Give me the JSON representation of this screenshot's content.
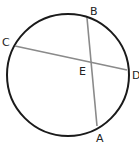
{
  "diagram": {
    "type": "circle-intersecting-chords",
    "colors": {
      "circle": "#1a1a1a",
      "chord": "#8a8a8a",
      "label": "#222222",
      "background": "#ffffff"
    },
    "circle": {
      "cx": 68,
      "cy": 75,
      "r": 61
    },
    "points": {
      "A": {
        "label": "A",
        "x": 97,
        "y": 126
      },
      "B": {
        "label": "B",
        "x": 87,
        "y": 18
      },
      "C": {
        "label": "C",
        "x": 15,
        "y": 46
      },
      "D": {
        "label": "D",
        "x": 127,
        "y": 70
      },
      "E": {
        "label": "E",
        "x": 90,
        "y": 61
      }
    },
    "chords": [
      {
        "from": "A",
        "to": "B"
      },
      {
        "from": "C",
        "to": "D"
      }
    ]
  }
}
